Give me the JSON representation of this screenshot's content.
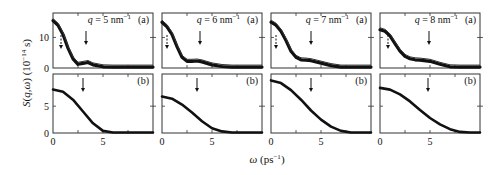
{
  "figure": {
    "ylabel": "S(q,ω) (10⁻¹⁴ s)",
    "xlabel": "ω (ps⁻¹)"
  },
  "chart_data": {
    "type": "line",
    "layout": "2 rows × 4 columns of panels; row (a) = measured/raw with error band, row (b) = model/fit",
    "xlabel": "ω (ps⁻¹)",
    "ylabel": "S(q,ω) (10⁻¹⁴ s)",
    "xlim": [
      0,
      10
    ],
    "xticks": [
      0,
      5
    ],
    "grid": false,
    "legend": "none",
    "panels": [
      {
        "q_label": "q = 5 nm⁻¹",
        "q": 5,
        "row_a": {
          "label": "(a)",
          "ylim": [
            0,
            18
          ],
          "yticks": [
            0,
            10
          ],
          "arrows_x": [
            0.8,
            3.3
          ],
          "x": [
            0,
            0.5,
            1,
            1.5,
            2,
            2.5,
            3,
            3.5,
            4,
            5,
            6,
            7,
            8,
            9,
            10
          ],
          "y": [
            15.5,
            14,
            11,
            6.5,
            3,
            1.2,
            1.5,
            1.8,
            1.0,
            0.4,
            0.3,
            0.3,
            0.3,
            0.3,
            0.3
          ]
        },
        "row_b": {
          "label": "(b)",
          "ylim": [
            0,
            11
          ],
          "yticks": [
            0,
            5
          ],
          "arrow_x": 3.0,
          "x": [
            0,
            1,
            2,
            3,
            4,
            5,
            6,
            7,
            8,
            9,
            10
          ],
          "y": [
            8.1,
            7.7,
            6.2,
            4.0,
            1.8,
            0.4,
            0.1,
            0.1,
            0.1,
            0.1,
            0.1
          ]
        }
      },
      {
        "q_label": "q = 6 nm⁻¹",
        "q": 6,
        "row_a": {
          "label": "(a)",
          "ylim": [
            0,
            18
          ],
          "yticks": [
            0,
            10
          ],
          "arrows_x": [
            0.5,
            3.8
          ],
          "x": [
            0,
            0.5,
            1,
            1.5,
            2,
            2.5,
            3,
            3.5,
            4,
            5,
            6,
            7,
            8,
            9,
            10
          ],
          "y": [
            15,
            13.5,
            11,
            7,
            3.5,
            2.2,
            2.2,
            2.3,
            2.0,
            1.0,
            0.5,
            0.3,
            0.3,
            0.3,
            0.3
          ]
        },
        "row_b": {
          "label": "(b)",
          "ylim": [
            0,
            11
          ],
          "yticks": [
            0,
            5
          ],
          "arrow_x": 3.5,
          "x": [
            0,
            1,
            2,
            3,
            4,
            5,
            6,
            7,
            8,
            9,
            10
          ],
          "y": [
            6.8,
            6.4,
            5.3,
            3.8,
            2.2,
            0.9,
            0.3,
            0.1,
            0.1,
            0.1,
            0.1
          ]
        }
      },
      {
        "q_label": "q = 7 nm⁻¹",
        "q": 7,
        "row_a": {
          "label": "(a)",
          "ylim": [
            0,
            18
          ],
          "yticks": [
            0,
            10
          ],
          "arrows_x": [
            0.5,
            4.0
          ],
          "x": [
            0,
            0.5,
            1,
            1.5,
            2,
            2.5,
            3,
            3.5,
            4,
            5,
            6,
            7,
            8,
            9,
            10
          ],
          "y": [
            15,
            14,
            12,
            9,
            5.5,
            3.5,
            2.7,
            2.6,
            2.4,
            1.6,
            0.8,
            0.3,
            0.3,
            0.3,
            0.3
          ]
        },
        "row_b": {
          "label": "(b)",
          "ylim": [
            0,
            11
          ],
          "yticks": [
            0,
            5
          ],
          "arrow_x": 4.0,
          "x": [
            0,
            1,
            2,
            3,
            4,
            5,
            6,
            7,
            8,
            9,
            10
          ],
          "y": [
            9.8,
            9.3,
            8.0,
            6.2,
            4.2,
            2.5,
            1.2,
            0.4,
            0.1,
            0.1,
            0.1
          ]
        }
      },
      {
        "q_label": "q = 8 nm⁻¹",
        "q": 8,
        "row_a": {
          "label": "(a)",
          "ylim": [
            0,
            18
          ],
          "yticks": [
            0,
            10
          ],
          "arrows_x": [
            0.8,
            4.9
          ],
          "x": [
            0,
            0.5,
            1,
            1.5,
            2,
            2.5,
            3,
            3.5,
            4,
            5,
            6,
            7,
            8,
            9,
            10
          ],
          "y": [
            12.5,
            12,
            10.5,
            8,
            5.5,
            3.8,
            3.0,
            2.7,
            2.6,
            2.2,
            1.2,
            0.4,
            0.3,
            0.3,
            0.3
          ]
        },
        "row_b": {
          "label": "(b)",
          "ylim": [
            0,
            11
          ],
          "yticks": [
            0,
            5
          ],
          "arrow_x": 4.8,
          "x": [
            0,
            1,
            2,
            3,
            4,
            5,
            6,
            7,
            8,
            9,
            10
          ],
          "y": [
            8.4,
            8.1,
            7.2,
            5.9,
            4.3,
            2.8,
            1.6,
            0.7,
            0.2,
            0.1,
            0.1
          ]
        }
      }
    ]
  }
}
